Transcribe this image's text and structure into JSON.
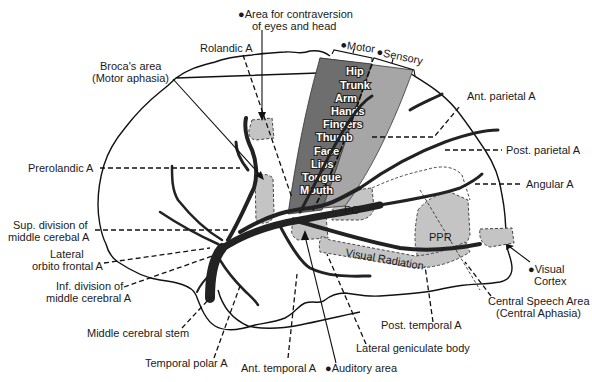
{
  "diagram": {
    "colors": {
      "motor_strip": "#6e6e6e",
      "sensory_strip": "#a6a6a6",
      "territory_patch": "#c4c4c4",
      "vessel": "#222222",
      "background": "#ffffff"
    },
    "strip_headers": {
      "motor": "●Motor",
      "sensory": "●Sensory"
    },
    "homunculus": [
      "Hip",
      "Trunk",
      "Arm",
      "Hands",
      "Fingers",
      "Thumb",
      "Face",
      "Lips",
      "Tongue",
      "Mouth"
    ],
    "inner_labels": {
      "po": "PO",
      "ppr": "PPR",
      "visual_radiation": "Visual Radiation"
    },
    "labels": {
      "eyes_head_line1": "●Area for contraversion",
      "eyes_head_line2": "of eyes and head",
      "rolandic": "Rolandic A",
      "broca_line1": "Broca's area",
      "broca_line2": "(Motor aphasia)",
      "ant_parietal": "Ant. parietal A",
      "prerolandic": "Prerolandic A",
      "post_parietal": "Post. parietal A",
      "angular": "Angular A",
      "sup_div_line1": "Sup. division of",
      "sup_div_line2": "middle cerebal A",
      "lat_orbito_line1": "Lateral",
      "lat_orbito_line2": "orbito frontal A",
      "inf_div_line1": "Inf. division of",
      "inf_div_line2": "middle cerebral A",
      "visual_cortex_line1": "●Visual",
      "visual_cortex_line2": "Cortex",
      "central_speech_line1": "Central Speech Area",
      "central_speech_line2": "(Central Aphasia)",
      "mca_stem": "Middle cerebral stem",
      "post_temporal": "Post. temporal A",
      "temporal_polar": "Temporal polar A",
      "lateral_geniculate": "Lateral geniculate body",
      "ant_temporal": "Ant. temporal A",
      "auditory": "●Auditory area"
    }
  }
}
